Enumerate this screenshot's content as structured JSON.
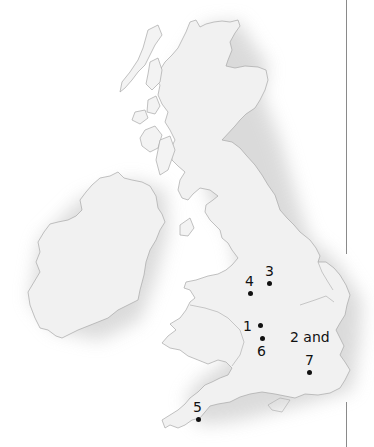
{
  "map": {
    "region": "British Isles",
    "land_fill": "#efefef",
    "coast_stroke": "#a8a8a8",
    "shadow_color": "#d9d9d9",
    "marker_color": "#111111"
  },
  "markers": [
    {
      "id": "1",
      "label": "1"
    },
    {
      "id": "2-7",
      "label": "2 and",
      "label2": "7"
    },
    {
      "id": "3",
      "label": "3"
    },
    {
      "id": "4",
      "label": "4"
    },
    {
      "id": "5",
      "label": "5"
    },
    {
      "id": "6",
      "label": "6"
    }
  ]
}
